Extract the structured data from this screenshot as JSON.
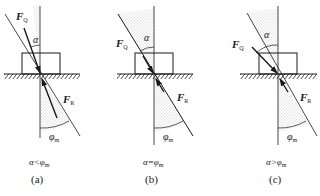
{
  "figure": {
    "colors": {
      "line": "#1a1a1a",
      "cone_fill": "#d6d6d6",
      "background": "#ffffff"
    },
    "panels": [
      {
        "id": "a",
        "force_applied": {
          "symbol": "F",
          "subscript": "Q"
        },
        "force_reaction": {
          "symbol": "F",
          "subscript": "R"
        },
        "angle_alpha": "α",
        "angle_friction": {
          "symbol": "φ",
          "subscript": "m"
        },
        "condition": "α<φ",
        "condition_sub": "m",
        "caption": "(a)"
      },
      {
        "id": "b",
        "force_applied": {
          "symbol": "F",
          "subscript": "Q"
        },
        "force_reaction": {
          "symbol": "F",
          "subscript": "R"
        },
        "angle_alpha": "α",
        "angle_friction": {
          "symbol": "φ",
          "subscript": "m"
        },
        "condition": "α=φ",
        "condition_sub": "m",
        "caption": "(b)"
      },
      {
        "id": "c",
        "force_applied": {
          "symbol": "F",
          "subscript": "Q"
        },
        "force_reaction": {
          "symbol": "F",
          "subscript": "R"
        },
        "angle_alpha": "α",
        "angle_friction": {
          "symbol": "φ",
          "subscript": "m"
        },
        "condition": "α>φ",
        "condition_sub": "m",
        "caption": "(c)"
      }
    ]
  }
}
